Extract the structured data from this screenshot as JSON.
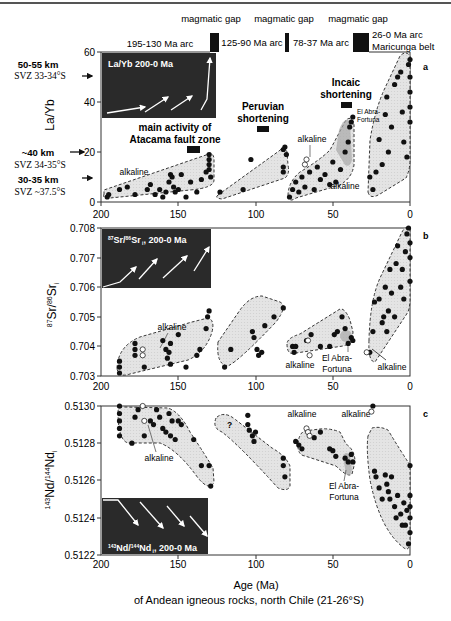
{
  "chart_data": [
    {
      "panel": "a",
      "type": "scatter",
      "ylabel": "La/Yb",
      "xlabel": "",
      "xlim": [
        200,
        0
      ],
      "ylim": [
        0,
        60
      ],
      "xticks": [
        "200",
        "150",
        "100",
        "50",
        "0"
      ],
      "yticks": [
        "0",
        "20",
        "40",
        "60"
      ],
      "inset_title": "La/Yb 200-0 Ma",
      "annotations": {
        "depth_markers": [
          {
            "depth": "50-55 km",
            "ref": "SVZ 33-34°S",
            "y": 50
          },
          {
            "depth": "~40 km",
            "ref": "SVZ 34-35°S",
            "y": 20
          },
          {
            "depth": "30-35 km",
            "ref": "SVZ ~37.5°S",
            "y": 10
          }
        ],
        "events": [
          {
            "label": "main activity of\nAtacama fault zone",
            "age_start": 155,
            "age_end": 140
          },
          {
            "label": "Peruvian\nshortening",
            "age_start": 100,
            "age_end": 92
          },
          {
            "label": "Incaic\nshortening",
            "age_start": 44,
            "age_end": 38
          }
        ],
        "labels": [
          "alkaline",
          "alkaline",
          "alkaline",
          "El Abra-\nFortuna"
        ]
      },
      "series": [
        {
          "name": "195-130 Ma arc",
          "x": [
            196,
            195,
            188,
            183,
            178,
            170,
            168,
            165,
            162,
            160,
            158,
            156,
            155,
            154,
            153,
            152,
            150,
            148,
            145,
            142,
            138,
            135,
            132,
            130,
            130,
            130,
            130,
            129
          ],
          "y": [
            2,
            3,
            5,
            6,
            3,
            5,
            7,
            3,
            5,
            2,
            4,
            8,
            11,
            10,
            6,
            4,
            5,
            11,
            2,
            8,
            4,
            9,
            12,
            19,
            17,
            15,
            13,
            10
          ]
        },
        {
          "name": "125-90 Ma arc",
          "x": [
            123,
            108,
            103,
            82,
            82,
            82,
            81,
            80
          ],
          "y": [
            4,
            5,
            17,
            12,
            14,
            21,
            22,
            19
          ]
        },
        {
          "name": "78-37 Ma arc",
          "x": [
            78,
            76,
            74,
            72,
            70,
            68,
            65,
            62,
            60,
            58,
            55,
            52,
            50,
            48,
            45,
            42,
            40,
            39,
            38,
            37
          ],
          "y": [
            2,
            5,
            8,
            4,
            10,
            6,
            12,
            5,
            14,
            9,
            11,
            7,
            16,
            8,
            13,
            20,
            24,
            30,
            32,
            34
          ]
        },
        {
          "name": "26-0 Ma arc / Maricunga belt",
          "x": [
            26,
            24,
            22,
            20,
            18,
            16,
            15,
            14,
            12,
            10,
            8,
            6,
            5,
            4,
            2,
            1,
            0,
            0,
            0,
            0,
            0
          ],
          "y": [
            10,
            5,
            12,
            25,
            15,
            35,
            42,
            20,
            30,
            47,
            50,
            52,
            36,
            24,
            18,
            55,
            57,
            50,
            44,
            38,
            32
          ]
        },
        {
          "name": "alkaline",
          "x": [
            68,
            67
          ],
          "y": [
            15,
            17
          ],
          "marker": "open"
        }
      ]
    },
    {
      "panel": "b",
      "type": "scatter",
      "ylabel": "87Sr/86Sr i",
      "xlim": [
        200,
        0
      ],
      "ylim": [
        0.703,
        0.708
      ],
      "xticks": [
        "200",
        "150",
        "100",
        "50",
        "0"
      ],
      "yticks": [
        "0.703",
        "0.704",
        "0.705",
        "0.706",
        "0.707",
        "0.708"
      ],
      "inset_title": "87Sr/86Sr i 200-0 Ma",
      "annotations": {
        "labels": [
          "alkaline",
          "alkaline",
          "El Abra-\nFortuna",
          "alkaline"
        ]
      },
      "series": [
        {
          "name": "195-130 Ma arc",
          "x": [
            188,
            188,
            188,
            178,
            178,
            178,
            172,
            160,
            158,
            157,
            156,
            155,
            155,
            150,
            145,
            138,
            136,
            132,
            130,
            131
          ],
          "y": [
            0.7031,
            0.7033,
            0.7035,
            0.7039,
            0.7041,
            0.7037,
            0.7033,
            0.7042,
            0.7039,
            0.7036,
            0.7038,
            0.7041,
            0.7034,
            0.7044,
            0.7033,
            0.7037,
            0.7039,
            0.7046,
            0.7052,
            0.705
          ]
        },
        {
          "name": "125-90 Ma arc",
          "x": [
            120,
            116,
            102,
            101,
            99,
            98,
            96,
            94,
            88,
            82
          ],
          "y": [
            0.7033,
            0.7039,
            0.7045,
            0.7043,
            0.7039,
            0.7037,
            0.7038,
            0.7047,
            0.705,
            0.7053
          ]
        },
        {
          "name": "78-37 Ma arc",
          "x": [
            76,
            75,
            74,
            67,
            64,
            58,
            52,
            49,
            47,
            44,
            42,
            40,
            38,
            37
          ],
          "y": [
            0.704,
            0.7038,
            0.704,
            0.7042,
            0.7044,
            0.704,
            0.704,
            0.7044,
            0.7045,
            0.705,
            0.7046,
            0.7041,
            0.7043,
            0.7042
          ]
        },
        {
          "name": "26-0 Ma arc",
          "x": [
            26,
            24,
            23,
            20,
            18,
            17,
            16,
            15,
            14,
            13,
            12,
            10,
            9,
            8,
            6,
            5,
            4,
            3,
            2,
            1,
            0,
            0,
            0
          ],
          "y": [
            0.7038,
            0.7045,
            0.7055,
            0.7056,
            0.7048,
            0.705,
            0.706,
            0.7045,
            0.7052,
            0.7066,
            0.7058,
            0.705,
            0.7068,
            0.7074,
            0.706,
            0.7066,
            0.7056,
            0.7072,
            0.7078,
            0.708,
            0.7062,
            0.707,
            0.7075
          ]
        },
        {
          "name": "alkaline",
          "x": [
            173,
            173,
            66,
            65,
            28
          ],
          "y": [
            0.7037,
            0.7039,
            0.7042,
            0.7037,
            0.7038
          ],
          "marker": "open"
        }
      ]
    },
    {
      "panel": "c",
      "type": "scatter",
      "ylabel": "143Nd/144Nd i",
      "xlabel": "Age (Ma)",
      "xlim": [
        200,
        0
      ],
      "ylim": [
        0.5122,
        0.513
      ],
      "xticks": [
        "200",
        "150",
        "100",
        "50",
        "0"
      ],
      "yticks": [
        "0.5122",
        "0.5124",
        "0.5126",
        "0.5128",
        "0.5130"
      ],
      "inset_title": "143Nd/144Nd i 200-0 Ma",
      "annotations": {
        "labels": [
          "alkaline",
          "?",
          "alkaline",
          "alkaline",
          "El Abra-\nFortuna"
        ]
      },
      "series": [
        {
          "name": "195-130 Ma arc",
          "x": [
            188,
            188,
            188,
            188,
            188,
            180,
            178,
            176,
            172,
            168,
            166,
            164,
            162,
            160,
            158,
            156,
            155,
            154,
            152,
            150,
            148,
            140,
            135,
            130,
            129
          ],
          "y": [
            0.513,
            0.51296,
            0.51292,
            0.51288,
            0.51284,
            0.5128,
            0.51294,
            0.51298,
            0.51284,
            0.51292,
            0.5129,
            0.51298,
            0.51294,
            0.51288,
            0.51286,
            0.51296,
            0.51284,
            0.51292,
            0.51282,
            0.51292,
            0.5129,
            0.51282,
            0.51268,
            0.51268,
            0.51257
          ]
        },
        {
          "name": "125-90 Ma arc",
          "x": [
            105,
            105,
            104,
            102,
            101,
            100,
            82,
            82,
            81
          ],
          "y": [
            0.51295,
            0.5129,
            0.51287,
            0.51284,
            0.51281,
            0.51286,
            0.51272,
            0.51268,
            0.51262
          ]
        },
        {
          "name": "78-37 Ma arc",
          "x": [
            74,
            72,
            70,
            62,
            58,
            52,
            50,
            48,
            42,
            40,
            38,
            37
          ],
          "y": [
            0.51281,
            0.51279,
            0.51277,
            0.51283,
            0.51286,
            0.51277,
            0.51276,
            0.51273,
            0.51272,
            0.5127,
            0.51274,
            0.5127
          ]
        },
        {
          "name": "26-0 Ma arc",
          "x": [
            24,
            23,
            22,
            20,
            18,
            16,
            15,
            14,
            13,
            12,
            10,
            9,
            8,
            6,
            5,
            4,
            3,
            2,
            1,
            0,
            0,
            0,
            0,
            0
          ],
          "y": [
            0.513,
            0.51265,
            0.51262,
            0.51256,
            0.5125,
            0.51263,
            0.51258,
            0.51254,
            0.5125,
            0.51262,
            0.51246,
            0.5124,
            0.51252,
            0.51242,
            0.51236,
            0.51248,
            0.51236,
            0.51244,
            0.51226,
            0.51232,
            0.5124,
            0.51246,
            0.51252,
            0.51268
          ]
        },
        {
          "name": "alkaline",
          "x": [
            173,
            172,
            67,
            66,
            65,
            25
          ],
          "y": [
            0.513,
            0.51292,
            0.51288,
            0.51286,
            0.51284,
            0.51297
          ],
          "marker": "open"
        }
      ]
    }
  ],
  "header": {
    "gap_label": "magmatic gap",
    "arcs": [
      "195-130 Ma arc",
      "125-90 Ma arc",
      "78-37 Ma arc",
      "26-0 Ma arc",
      "Maricunga belt"
    ]
  },
  "panel_a": {
    "letter": "a",
    "ylabel": "La/Yb",
    "yticks": [
      "60",
      "40",
      "20",
      "0"
    ],
    "xticks": [
      "200",
      "150",
      "100",
      "50",
      "0"
    ],
    "inset": "La/Yb 200-0 Ma",
    "depth1": "50-55 km",
    "ref1": "SVZ 33-34°S",
    "depth2": "~40 km",
    "ref2": "SVZ 34-35°S",
    "depth3": "30-35 km",
    "ref3": "SVZ ~37.5°S",
    "atacama1": "main activity of",
    "atacama2": "Atacama fault zone",
    "peru1": "Peruvian",
    "peru2": "shortening",
    "incaic1": "Incaic",
    "incaic2": "shortening",
    "alkaline": "alkaline",
    "abra1": "El Abra-",
    "abra2": "Fortuna"
  },
  "panel_b": {
    "letter": "b",
    "yticks": [
      "0.708",
      "0.707",
      "0.706",
      "0.705",
      "0.704",
      "0.703"
    ],
    "xticks": [
      "200",
      "150",
      "100",
      "50",
      "0"
    ],
    "inset_sr": "Sr/",
    "inset_sr2": "Sr",
    "inset_rest": ", 200-0 Ma",
    "alkaline": "alkaline",
    "abra1": "El Abra-",
    "abra2": "Fortuna"
  },
  "panel_c": {
    "letter": "c",
    "yticks": [
      "0.5130",
      "0.5128",
      "0.5126",
      "0.5124",
      "0.5122"
    ],
    "xticks": [
      "200",
      "150",
      "100",
      "50",
      "0"
    ],
    "question": "?",
    "alkaline": "alkaline",
    "abra1": "El Abra-",
    "abra2": "Fortuna"
  },
  "footer": {
    "xlabel": "Age (Ma)",
    "caption": "of Andean igneous rocks, north Chile (21-26°S)"
  }
}
